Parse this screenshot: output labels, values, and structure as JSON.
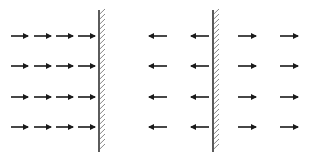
{
  "diagram": {
    "colors": {
      "arrow": "#1a1a1a",
      "wall": "#333333",
      "hatch": "#555555",
      "background": "#ffffff"
    },
    "walls": [
      {
        "name": "left-wall",
        "x": 99,
        "y_top": 10,
        "y_bottom": 152,
        "hatch_side": "right"
      },
      {
        "name": "right-wall",
        "x": 213,
        "y_top": 10,
        "y_bottom": 152,
        "hatch_side": "right"
      }
    ],
    "rows_y": [
      36,
      66,
      97,
      127
    ],
    "panel_left": {
      "label": "incident arrows pointing toward wall",
      "direction": "right",
      "arrows_x": [
        [
          11,
          28
        ],
        [
          34,
          51
        ],
        [
          56,
          73
        ],
        [
          78,
          95
        ]
      ]
    },
    "panel_right": {
      "left_of_wall": {
        "direction": "left",
        "arrows_x": [
          [
            149,
            167
          ],
          [
            191,
            209
          ]
        ]
      },
      "right_of_wall": {
        "direction": "right",
        "arrows_x": [
          [
            238,
            256
          ],
          [
            280,
            298
          ]
        ]
      }
    }
  }
}
